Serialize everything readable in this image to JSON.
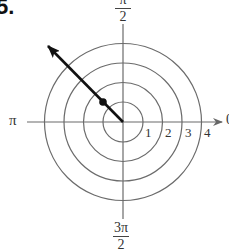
{
  "problem": {
    "number": "5."
  },
  "polar_grid": {
    "center": [
      123,
      122
    ],
    "unit_px": 19.6,
    "rings": [
      1,
      2,
      3,
      4
    ],
    "ring_labels": [
      "1",
      "2",
      "3",
      "4"
    ],
    "angle_labels": {
      "right": "0",
      "top": {
        "num": "π",
        "den": "2"
      },
      "left": "π",
      "bottom": {
        "num": "3π",
        "den": "2"
      }
    },
    "line_color": "#666666",
    "vector_color": "#111111"
  },
  "plotted_point": {
    "r": 1.414,
    "theta_label": "3π/4",
    "description": "point on ray at angle 3π/4"
  },
  "ray": {
    "angle": "3π/4",
    "has_arrow": true
  }
}
